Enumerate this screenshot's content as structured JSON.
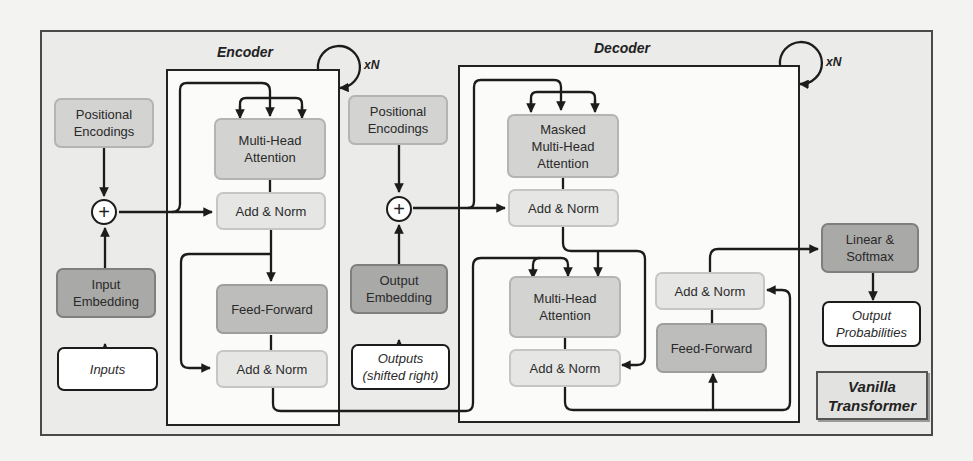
{
  "diagram": {
    "label": "Vanilla Transformer",
    "label_lines": [
      "Vanilla",
      "Transformer"
    ],
    "encoder": {
      "title": "Encoder",
      "repeat": "xN",
      "input": "Inputs",
      "input_embedding": [
        "Input",
        "Embedding"
      ],
      "positional_encodings": [
        "Positional",
        "Encodings"
      ],
      "add_symbol": "+",
      "multi_head_attention": [
        "Multi-Head",
        "Attention"
      ],
      "add_norm_1": "Add & Norm",
      "feed_forward": "Feed-Forward",
      "add_norm_2": "Add & Norm"
    },
    "decoder": {
      "title": "Decoder",
      "repeat": "xN",
      "input": [
        "Outputs",
        "(shifted right)"
      ],
      "output_embedding": [
        "Output",
        "Embedding"
      ],
      "positional_encodings": [
        "Positional",
        "Encodings"
      ],
      "add_symbol": "+",
      "masked_multi_head_attention": [
        "Masked",
        "Multi-Head",
        "Attention"
      ],
      "add_norm_1": "Add & Norm",
      "multi_head_attention": [
        "Multi-Head",
        "Attention"
      ],
      "add_norm_2": "Add & Norm",
      "feed_forward": "Feed-Forward",
      "add_norm_3": "Add & Norm"
    },
    "head": {
      "linear_softmax": [
        "Linear &",
        "Softmax"
      ],
      "output": [
        "Output",
        "Probabilities"
      ]
    },
    "colors": {
      "attention": "#d3d3d1",
      "add_norm": "#e6e6e4",
      "feed_forward": "#bdbdbb",
      "embedding": "#a9a9a7",
      "io": "#ffffff",
      "background": "#ebebe9"
    }
  }
}
